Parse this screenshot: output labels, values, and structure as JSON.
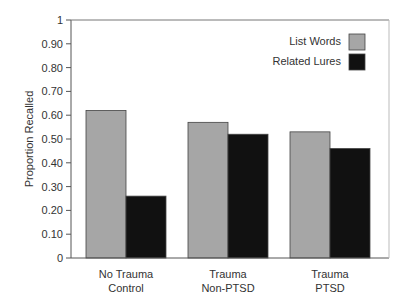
{
  "chart_data": {
    "type": "bar",
    "title": "",
    "xlabel": "",
    "ylabel": "Proportion Recalled",
    "ylim": [
      0,
      1
    ],
    "yticks": [
      "0",
      "0.10",
      "0.20",
      "0.30",
      "0.40",
      "0.50",
      "0.60",
      "0.70",
      "0.80",
      "0.90",
      "1"
    ],
    "categories": [
      [
        "No Trauma",
        "Control"
      ],
      [
        "Trauma",
        "Non-PTSD"
      ],
      [
        "Trauma",
        "PTSD"
      ]
    ],
    "series": [
      {
        "name": "List Words",
        "color": "#a6a6a6",
        "values": [
          0.62,
          0.57,
          0.53
        ]
      },
      {
        "name": "Related Lures",
        "color": "#111111",
        "values": [
          0.26,
          0.52,
          0.46
        ]
      }
    ],
    "grid": false,
    "legend_position": "top-right inside plot"
  }
}
